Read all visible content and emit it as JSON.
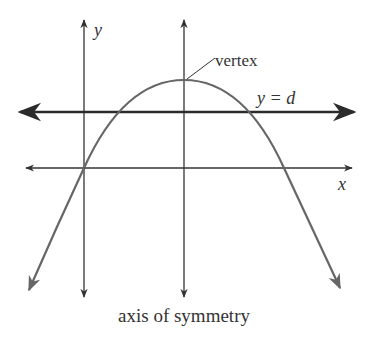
{
  "figure": {
    "type": "parabola-diagram",
    "labels": {
      "y_axis": "y",
      "x_axis": "x",
      "vertex": "vertex",
      "horizontal_line": "y = d",
      "axis_of_symmetry": "axis of symmetry"
    },
    "colors": {
      "axes": "#333333",
      "curve": "#666666",
      "horizontal_line": "#2b2b2b",
      "text": "#333333",
      "background": "#ffffff"
    }
  }
}
